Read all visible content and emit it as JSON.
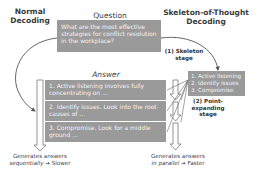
{
  "left_column": {
    "title_line1": "Normal",
    "title_line2": "Decoding"
  },
  "right_column": {
    "title_line1": "Skeleton-of-Thought",
    "title_line2": "Decoding"
  },
  "question": {
    "label": "Question",
    "text": "What are the most effective strategies for conflict resolution in the workplace?"
  },
  "answer": {
    "label": "Answer",
    "points": [
      "1. Active listening involves fully concentrating on ...",
      "2. Identify issues. Look into the root causes of ...",
      "3. Compromise. Look for a middle ground ..."
    ]
  },
  "skeleton": {
    "points": [
      "1. Active listening",
      "2. Identify issues",
      "3. Compromise"
    ]
  },
  "stages": {
    "skeleton_line1": "(1) Skeleton",
    "skeleton_line2": "stage",
    "expand_line1": "(2) Point-",
    "expand_line2": "expanding",
    "expand_line3": "stage"
  },
  "captions": {
    "normal_line1": "Generates answers",
    "normal_emph": "sequentially",
    "normal_arrow": "➔",
    "normal_result": "Slower",
    "sot_line1": "Generates answers",
    "sot_emph": "in parallel",
    "sot_arrow": "➔",
    "sot_result": "Faster"
  },
  "colors": {
    "box_fill": "#9a9a9a",
    "box_text": "#f4f4f4",
    "line": "#555555"
  }
}
